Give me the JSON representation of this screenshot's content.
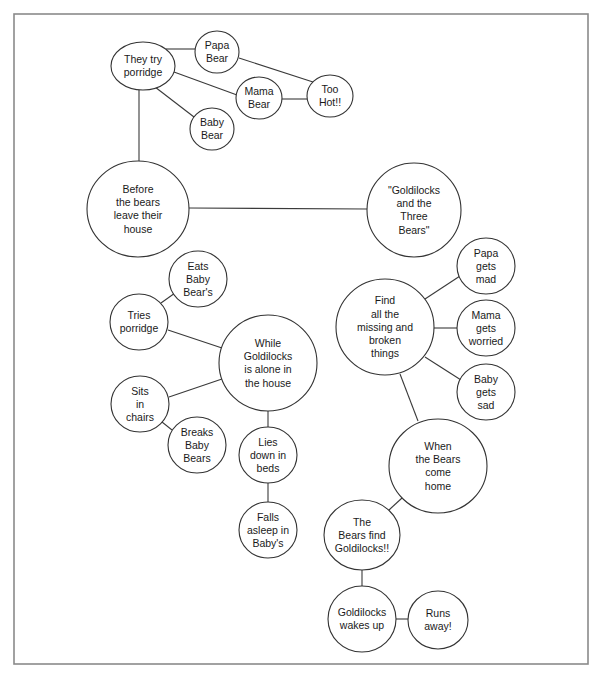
{
  "diagram": {
    "type": "bubble-map",
    "colors": {
      "line": "#3a3a3a",
      "frame": "#8a8a8a",
      "background": "#ffffff"
    },
    "nodes": [
      {
        "id": "title",
        "lines": [
          "\"Goldilocks",
          "and the",
          "Three",
          "Bears\""
        ],
        "cx": 414,
        "cy": 210,
        "rx": 47,
        "ry": 47
      },
      {
        "id": "before",
        "lines": [
          "Before",
          "the bears",
          "leave their",
          "house"
        ],
        "cx": 138,
        "cy": 209,
        "rx": 51,
        "ry": 48
      },
      {
        "id": "try",
        "lines": [
          "They try",
          "porridge"
        ],
        "cx": 143,
        "cy": 66,
        "rx": 32,
        "ry": 24
      },
      {
        "id": "papa",
        "lines": [
          "Papa",
          "Bear"
        ],
        "cx": 217,
        "cy": 52,
        "rx": 22,
        "ry": 21
      },
      {
        "id": "mama",
        "lines": [
          "Mama",
          "Bear"
        ],
        "cx": 259,
        "cy": 98,
        "rx": 23,
        "ry": 21
      },
      {
        "id": "baby",
        "lines": [
          "Baby",
          "Bear"
        ],
        "cx": 212,
        "cy": 129,
        "rx": 22,
        "ry": 21
      },
      {
        "id": "hot",
        "lines": [
          "Too",
          "Hot!!"
        ],
        "cx": 330,
        "cy": 96,
        "rx": 23,
        "ry": 21
      },
      {
        "id": "while",
        "lines": [
          "While",
          "Goldilocks",
          "is alone in",
          "the house"
        ],
        "cx": 268,
        "cy": 363,
        "rx": 49,
        "ry": 48
      },
      {
        "id": "tries",
        "lines": [
          "Tries",
          "porridge"
        ],
        "cx": 139,
        "cy": 322,
        "rx": 29,
        "ry": 28
      },
      {
        "id": "eats",
        "lines": [
          "Eats",
          "Baby",
          "Bear's"
        ],
        "cx": 198,
        "cy": 279,
        "rx": 29,
        "ry": 28
      },
      {
        "id": "sits",
        "lines": [
          "Sits",
          "in",
          "chairs"
        ],
        "cx": 140,
        "cy": 404,
        "rx": 29,
        "ry": 28
      },
      {
        "id": "breaks",
        "lines": [
          "Breaks",
          "Baby",
          "Bears"
        ],
        "cx": 197,
        "cy": 445,
        "rx": 29,
        "ry": 28
      },
      {
        "id": "lies",
        "lines": [
          "Lies",
          "down in",
          "beds"
        ],
        "cx": 268,
        "cy": 455,
        "rx": 29,
        "ry": 28
      },
      {
        "id": "falls",
        "lines": [
          "Falls",
          "asleep in",
          "Baby's"
        ],
        "cx": 268,
        "cy": 530,
        "rx": 29,
        "ry": 28
      },
      {
        "id": "find",
        "lines": [
          "Find",
          "all the",
          "missing and",
          "broken",
          "things"
        ],
        "cx": 385,
        "cy": 327,
        "rx": 49,
        "ry": 48
      },
      {
        "id": "papamad",
        "lines": [
          "Papa",
          "gets",
          "mad"
        ],
        "cx": 486,
        "cy": 266,
        "rx": 29,
        "ry": 28
      },
      {
        "id": "mamaworried",
        "lines": [
          "Mama",
          "gets",
          "worried"
        ],
        "cx": 486,
        "cy": 328,
        "rx": 29,
        "ry": 28
      },
      {
        "id": "babysad",
        "lines": [
          "Baby",
          "gets",
          "sad"
        ],
        "cx": 486,
        "cy": 392,
        "rx": 29,
        "ry": 28
      },
      {
        "id": "when",
        "lines": [
          "When",
          "the Bears",
          "come",
          "home"
        ],
        "cx": 438,
        "cy": 466,
        "rx": 49,
        "ry": 47
      },
      {
        "id": "bearsfind",
        "lines": [
          "The",
          "Bears find",
          "Goldilocks!!"
        ],
        "cx": 362,
        "cy": 535,
        "rx": 38,
        "ry": 35
      },
      {
        "id": "wakes",
        "lines": [
          "Goldilocks",
          "wakes up"
        ],
        "cx": 362,
        "cy": 619,
        "rx": 34,
        "ry": 33
      },
      {
        "id": "runs",
        "lines": [
          "Runs",
          "away!"
        ],
        "cx": 438,
        "cy": 620,
        "rx": 30,
        "ry": 29
      }
    ],
    "edges": [
      {
        "from": "before",
        "to": "title",
        "x1": 189,
        "y1": 208,
        "x2": 367,
        "y2": 209
      },
      {
        "from": "try",
        "to": "before",
        "x1": 139,
        "y1": 90,
        "x2": 139,
        "y2": 161
      },
      {
        "from": "try",
        "to": "papa",
        "x1": 166,
        "y1": 49,
        "x2": 195,
        "y2": 49
      },
      {
        "from": "try",
        "to": "mama",
        "x1": 174,
        "y1": 72,
        "x2": 237,
        "y2": 95
      },
      {
        "from": "try",
        "to": "baby",
        "x1": 155,
        "y1": 87,
        "x2": 194,
        "y2": 117
      },
      {
        "from": "papa",
        "to": "hot",
        "x1": 239,
        "y1": 58,
        "x2": 313,
        "y2": 82
      },
      {
        "from": "mama",
        "to": "hot",
        "x1": 282,
        "y1": 99,
        "x2": 307,
        "y2": 99
      },
      {
        "from": "tries",
        "to": "eats",
        "x1": 161,
        "y1": 303,
        "x2": 175,
        "y2": 293
      },
      {
        "from": "tries",
        "to": "while",
        "x1": 168,
        "y1": 330,
        "x2": 222,
        "y2": 348
      },
      {
        "from": "sits",
        "to": "while",
        "x1": 169,
        "y1": 397,
        "x2": 222,
        "y2": 379
      },
      {
        "from": "sits",
        "to": "breaks",
        "x1": 162,
        "y1": 422,
        "x2": 172,
        "y2": 430
      },
      {
        "from": "while",
        "to": "lies",
        "x1": 268,
        "y1": 411,
        "x2": 268,
        "y2": 427
      },
      {
        "from": "lies",
        "to": "falls",
        "x1": 268,
        "y1": 483,
        "x2": 268,
        "y2": 502
      },
      {
        "from": "find",
        "to": "papamad",
        "x1": 425,
        "y1": 299,
        "x2": 460,
        "y2": 276
      },
      {
        "from": "find",
        "to": "mamaworried",
        "x1": 434,
        "y1": 328,
        "x2": 457,
        "y2": 328
      },
      {
        "from": "find",
        "to": "babysad",
        "x1": 425,
        "y1": 357,
        "x2": 461,
        "y2": 380
      },
      {
        "from": "find",
        "to": "when",
        "x1": 400,
        "y1": 374,
        "x2": 418,
        "y2": 421
      },
      {
        "from": "when",
        "to": "bearsfind",
        "x1": 402,
        "y1": 498,
        "x2": 389,
        "y2": 510
      },
      {
        "from": "bearsfind",
        "to": "wakes",
        "x1": 362,
        "y1": 570,
        "x2": 362,
        "y2": 586
      },
      {
        "from": "wakes",
        "to": "runs",
        "x1": 396,
        "y1": 619,
        "x2": 408,
        "y2": 619
      }
    ]
  }
}
